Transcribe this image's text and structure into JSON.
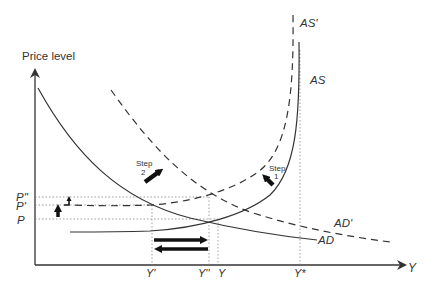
{
  "axes": {
    "y_label": "Price level",
    "x_label": "Y"
  },
  "price_ticks": [
    {
      "label": "P''",
      "y": 197
    },
    {
      "label": "P'",
      "y": 205
    },
    {
      "label": "P",
      "y": 219
    }
  ],
  "output_ticks": [
    {
      "label": "Y'",
      "x": 152
    },
    {
      "label": "Y''",
      "x": 209
    },
    {
      "label": "Y",
      "x": 218
    },
    {
      "label": "Y*",
      "x": 300
    }
  ],
  "curves": {
    "AS": {
      "label": "AS",
      "style": "solid"
    },
    "AS_prime": {
      "label": "AS'",
      "style": "dashed"
    },
    "AD": {
      "label": "AD",
      "style": "solid"
    },
    "AD_prime": {
      "label": "AD'",
      "style": "dashed"
    }
  },
  "annotations": {
    "step1": {
      "line1": "Step",
      "line2": "1"
    },
    "step2": {
      "line1": "Step",
      "line2": "2"
    }
  },
  "colors": {
    "line": "#333333",
    "guide": "#888888",
    "arrow": "#111111"
  }
}
